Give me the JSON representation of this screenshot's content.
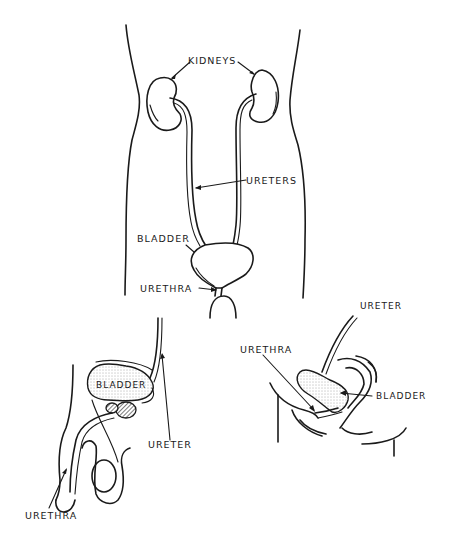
{
  "diagram": {
    "background": "#ffffff",
    "ink": "#1a1a1a",
    "panels": [
      {
        "id": "front-view",
        "labels": {
          "kidneys": "KIDNEYS",
          "ureters": "URETERS",
          "bladder": "BLADDER",
          "urethra": "URETHRA"
        }
      },
      {
        "id": "male-side-view",
        "labels": {
          "bladder": "BLADDER",
          "ureter": "URETER",
          "urethra": "URETHRA"
        }
      },
      {
        "id": "female-side-view",
        "labels": {
          "ureter": "URETER",
          "urethra": "URETHRA",
          "bladder": "BLADDER"
        }
      }
    ]
  }
}
